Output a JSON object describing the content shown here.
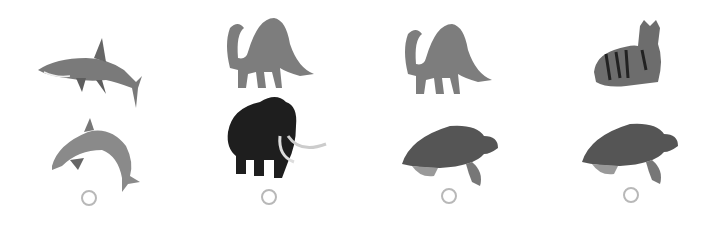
{
  "question": {
    "options": [
      {
        "id": "A",
        "animals": [
          "shark",
          "dolphin"
        ],
        "selected": false
      },
      {
        "id": "B",
        "animals": [
          "brachiosaurus",
          "woolly-mammoth"
        ],
        "selected": false
      },
      {
        "id": "C",
        "animals": [
          "brachiosaurus",
          "sea-turtle"
        ],
        "selected": false
      },
      {
        "id": "D",
        "animals": [
          "tiger",
          "sea-turtle"
        ],
        "selected": false
      }
    ]
  },
  "colors": {
    "radio_border": "#b8b8b8",
    "background": "#ffffff"
  }
}
